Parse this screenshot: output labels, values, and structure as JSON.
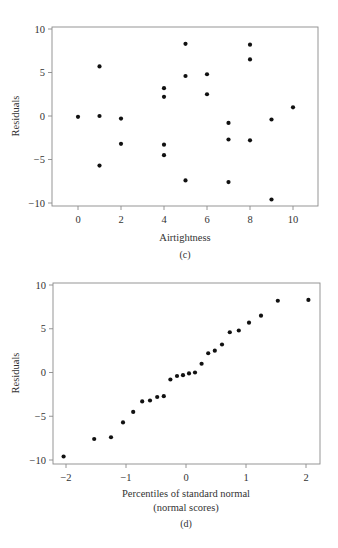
{
  "chart_data": [
    {
      "type": "scatter",
      "panel": "(c)",
      "caption": "(c)",
      "xlabel": "Airtightness",
      "ylabel": "Residuals",
      "xlim": [
        -1.2,
        11.2
      ],
      "ylim": [
        -10.3,
        10.3
      ],
      "xticks": [
        0,
        2,
        4,
        6,
        8,
        10
      ],
      "yticks": [
        -10,
        -5,
        0,
        5,
        10
      ],
      "ytick_labels": [
        "−10",
        "−5",
        "0",
        "5",
        "10"
      ],
      "grid": false,
      "points": [
        {
          "x": 0,
          "y": -0.1
        },
        {
          "x": 1,
          "y": 5.7
        },
        {
          "x": 1,
          "y": 0.0
        },
        {
          "x": 1,
          "y": -5.7
        },
        {
          "x": 2,
          "y": -0.3
        },
        {
          "x": 2,
          "y": -3.2
        },
        {
          "x": 4,
          "y": 3.2
        },
        {
          "x": 4,
          "y": 2.2
        },
        {
          "x": 4,
          "y": -3.3
        },
        {
          "x": 4,
          "y": -4.5
        },
        {
          "x": 5,
          "y": 8.3
        },
        {
          "x": 5,
          "y": 4.6
        },
        {
          "x": 5,
          "y": -7.4
        },
        {
          "x": 6,
          "y": 4.8
        },
        {
          "x": 6,
          "y": 2.5
        },
        {
          "x": 7,
          "y": -0.8
        },
        {
          "x": 7,
          "y": -2.7
        },
        {
          "x": 7,
          "y": -7.6
        },
        {
          "x": 8,
          "y": 8.2
        },
        {
          "x": 8,
          "y": 6.5
        },
        {
          "x": 8,
          "y": -2.8
        },
        {
          "x": 9,
          "y": -0.4
        },
        {
          "x": 9,
          "y": -9.6
        },
        {
          "x": 10,
          "y": 1.0
        }
      ]
    },
    {
      "type": "scatter",
      "panel": "(d)",
      "caption": "(d)",
      "xlabel": "Percentiles of standard normal",
      "xlabel_line2": "(normal scores)",
      "ylabel": "Residuals",
      "xlim": [
        -2.2,
        2.25
      ],
      "ylim": [
        -10.4,
        10.4
      ],
      "xticks": [
        -2,
        -1,
        0,
        1,
        2
      ],
      "xtick_labels": [
        "−2",
        "−1",
        "0",
        "1",
        "2"
      ],
      "yticks": [
        -10,
        -5,
        0,
        5,
        10
      ],
      "ytick_labels": [
        "−10",
        "−5",
        "0",
        "5",
        "10"
      ],
      "grid": false,
      "points": [
        {
          "x": -2.04,
          "y": -9.6
        },
        {
          "x": -1.53,
          "y": -7.6
        },
        {
          "x": -1.25,
          "y": -7.4
        },
        {
          "x": -1.05,
          "y": -5.7
        },
        {
          "x": -0.88,
          "y": -4.5
        },
        {
          "x": -0.73,
          "y": -3.3
        },
        {
          "x": -0.6,
          "y": -3.2
        },
        {
          "x": -0.48,
          "y": -2.8
        },
        {
          "x": -0.37,
          "y": -2.7
        },
        {
          "x": -0.26,
          "y": -0.8
        },
        {
          "x": -0.15,
          "y": -0.4
        },
        {
          "x": -0.05,
          "y": -0.3
        },
        {
          "x": 0.05,
          "y": -0.1
        },
        {
          "x": 0.15,
          "y": 0.0
        },
        {
          "x": 0.26,
          "y": 1.0
        },
        {
          "x": 0.37,
          "y": 2.2
        },
        {
          "x": 0.48,
          "y": 2.5
        },
        {
          "x": 0.6,
          "y": 3.2
        },
        {
          "x": 0.73,
          "y": 4.6
        },
        {
          "x": 0.88,
          "y": 4.8
        },
        {
          "x": 1.05,
          "y": 5.7
        },
        {
          "x": 1.25,
          "y": 6.5
        },
        {
          "x": 1.53,
          "y": 8.2
        },
        {
          "x": 2.04,
          "y": 8.3
        }
      ]
    }
  ],
  "colors": {
    "point": "#111111",
    "frame": "#8a8a8a",
    "text": "#333333",
    "background": "#ffffff"
  }
}
